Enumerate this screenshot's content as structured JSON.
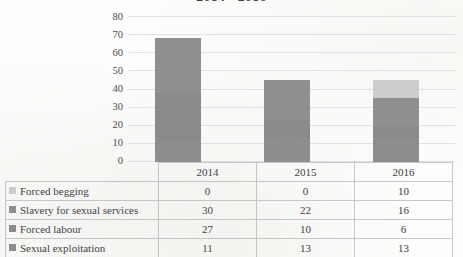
{
  "chart_data": {
    "type": "bar",
    "stacked": true,
    "title": "2014 - 2016",
    "xlabel": "",
    "ylabel": "",
    "categories": [
      "2014",
      "2015",
      "2016"
    ],
    "ylim": [
      0,
      80
    ],
    "yticks": [
      0,
      10,
      20,
      30,
      40,
      50,
      60,
      70,
      80
    ],
    "grid": true,
    "legend_position": "table-left",
    "series": [
      {
        "name": "Forced begging",
        "values": [
          0,
          0,
          10
        ],
        "color": "#cfcfcf"
      },
      {
        "name": "Slavery for sexual services",
        "values": [
          30,
          22,
          16
        ],
        "color": "#8f8f8f"
      },
      {
        "name": "Forced labour",
        "values": [
          27,
          10,
          6
        ],
        "color": "#8a8a8a"
      },
      {
        "name": "Sexual exploitation",
        "values": [
          11,
          13,
          13
        ],
        "color": "#8d8d8d"
      }
    ],
    "totals": [
      68,
      45,
      45
    ]
  },
  "table": {
    "header": {
      "corner": "",
      "years": [
        "2014",
        "2015",
        "2016"
      ]
    },
    "rows": [
      {
        "label": "Forced begging",
        "values": [
          "0",
          "0",
          "10"
        ]
      },
      {
        "label": "Slavery for sexual services",
        "values": [
          "30",
          "22",
          "16"
        ]
      },
      {
        "label": "Forced labour",
        "values": [
          "27",
          "10",
          "6"
        ]
      },
      {
        "label": "Sexual exploitation",
        "values": [
          "11",
          "13",
          "13"
        ]
      }
    ]
  },
  "axis": {
    "yticks": [
      "80",
      "70",
      "60",
      "50",
      "40",
      "30",
      "20",
      "10",
      "0"
    ]
  }
}
